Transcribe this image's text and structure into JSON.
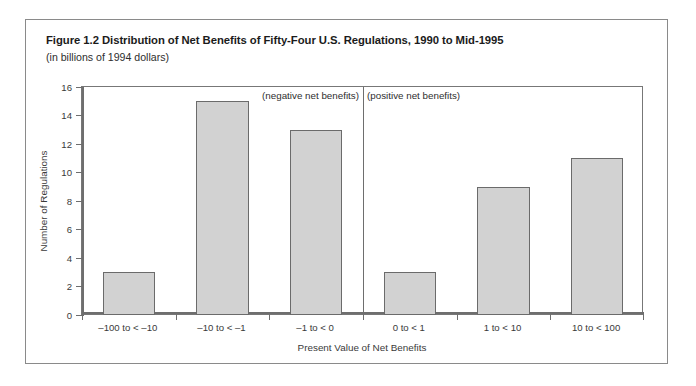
{
  "figure": {
    "title": "Figure 1.2 Distribution of Net Benefits of Fifty-Four U.S. Regulations, 1990 to Mid-1995",
    "subtitle": "(in billions of 1994 dollars)"
  },
  "colors": {
    "bar_fill": "#d2d2d2",
    "bar_border": "#6b6b6b",
    "axis": "#6e6e6e",
    "frame": "#8a8a8a",
    "text": "#3a3a3a",
    "title_text": "#1b1b1b",
    "background": "#ffffff"
  },
  "annotations": {
    "negative": "(negative net benefits)",
    "positive": "(positive net benefits)"
  },
  "chart_data": {
    "type": "bar",
    "title": "Figure 1.2 Distribution of Net Benefits of Fifty-Four U.S. Regulations, 1990 to Mid-1995",
    "subtitle": "(in billions of 1994 dollars)",
    "xlabel": "Present Value of Net Benefits",
    "ylabel": "Number of Regulations",
    "categories": [
      "–100 to < –10",
      "–10 to < –1",
      "–1 to < 0",
      "0 to < 1",
      "1 to < 10",
      "10 to < 100"
    ],
    "values": [
      3,
      15,
      13,
      3,
      9,
      11
    ],
    "ylim": [
      0,
      16
    ],
    "yticks": [
      0,
      2,
      4,
      6,
      8,
      10,
      12,
      14,
      16
    ],
    "ytick_labels": [
      "0",
      "2",
      "4",
      "6",
      "8",
      "10",
      "12",
      "14",
      "16"
    ],
    "grid": false,
    "legend": "none",
    "total": 54,
    "group_divider_after_category_index": 2,
    "annotations": [
      {
        "text": "(negative net benefits)",
        "group": "categories 1-3"
      },
      {
        "text": "(positive net benefits)",
        "group": "categories 4-6"
      }
    ]
  }
}
